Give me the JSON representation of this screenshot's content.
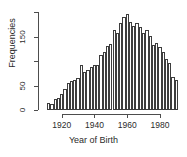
{
  "chart_data": {
    "type": "bar",
    "title": "",
    "subtitle": "",
    "xlabel": "Year of Birth",
    "ylabel": "Frequencies",
    "xlim": [
      1911,
      1991
    ],
    "ylim": [
      0,
      200
    ],
    "grid": false,
    "legend": null,
    "bin_width": 2,
    "x_ticks": [
      1920,
      1940,
      1960,
      1980
    ],
    "x_tick_labels": [
      "1920",
      "1940",
      "1960",
      "1980"
    ],
    "y_ticks": [
      0,
      50,
      100,
      150,
      200
    ],
    "y_tick_labels": [
      "0",
      "50",
      "",
      "150",
      ""
    ],
    "categories": [
      "1911",
      "1913",
      "1915",
      "1917",
      "1919",
      "1921",
      "1923",
      "1925",
      "1927",
      "1929",
      "1931",
      "1933",
      "1935",
      "1937",
      "1939",
      "1941",
      "1943",
      "1945",
      "1947",
      "1949",
      "1951",
      "1953",
      "1955",
      "1957",
      "1959",
      "1961",
      "1963",
      "1965",
      "1967",
      "1969",
      "1971",
      "1973",
      "1975",
      "1977",
      "1979",
      "1981",
      "1983",
      "1985",
      "1987",
      "1989"
    ],
    "values": [
      14,
      12,
      22,
      24,
      33,
      42,
      55,
      60,
      62,
      66,
      92,
      78,
      82,
      88,
      91,
      92,
      112,
      118,
      130,
      135,
      163,
      157,
      178,
      190,
      196,
      180,
      172,
      177,
      170,
      157,
      163,
      152,
      133,
      136,
      128,
      118,
      104,
      96,
      68,
      62
    ]
  }
}
